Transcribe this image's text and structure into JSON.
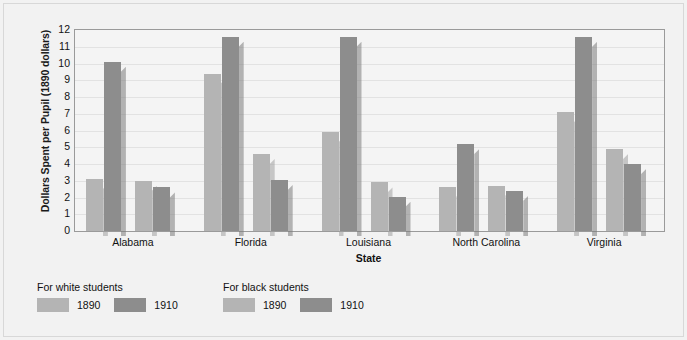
{
  "chart_data": {
    "type": "bar",
    "title": "",
    "xlabel": "State",
    "ylabel": "Dollars Spent per Pupil (1890 dollars)",
    "ylim": [
      0,
      12
    ],
    "yticks": [
      12,
      11,
      10,
      9,
      8,
      7,
      6,
      5,
      4,
      3,
      2,
      1,
      0
    ],
    "grid": true,
    "legend_position": "below-left",
    "categories": [
      "Alabama",
      "Florida",
      "Louisiana",
      "North Carolina",
      "Virginia"
    ],
    "series": [
      {
        "name": "For white students 1890",
        "group": "For white students",
        "year": "1890",
        "color": "#b4b4b4",
        "values": [
          3.1,
          9.4,
          5.9,
          2.65,
          7.1
        ]
      },
      {
        "name": "For white students 1910",
        "group": "For white students",
        "year": "1910",
        "color": "#8d8d8d",
        "values": [
          10.1,
          11.6,
          11.6,
          5.2,
          11.6
        ]
      },
      {
        "name": "For black students 1890",
        "group": "For black students",
        "year": "1890",
        "color": "#b4b4b4",
        "values": [
          3.0,
          4.6,
          2.9,
          2.7,
          4.9
        ]
      },
      {
        "name": "For black students 1910",
        "group": "For black students",
        "year": "1910",
        "color": "#8d8d8d",
        "values": [
          2.6,
          3.05,
          2.05,
          2.4,
          4.0
        ]
      }
    ]
  },
  "axis": {
    "y_title": "Dollars Spent per Pupil (1890 dollars)",
    "x_title": "State",
    "y_ticks": [
      "12",
      "11",
      "10",
      "9",
      "8",
      "7",
      "6",
      "5",
      "4",
      "3",
      "2",
      "1",
      "0"
    ],
    "x_labels": [
      "Alabama",
      "Florida",
      "Louisiana",
      "North Carolina",
      "Virginia"
    ]
  },
  "legend": {
    "groups": [
      {
        "title": "For white students",
        "items": [
          {
            "label": "1890",
            "color": "#b4b4b4",
            "shade": "light"
          },
          {
            "label": "1910",
            "color": "#8d8d8d",
            "shade": "dark"
          }
        ]
      },
      {
        "title": "For black students",
        "items": [
          {
            "label": "1890",
            "color": "#b4b4b4",
            "shade": "light"
          },
          {
            "label": "1910",
            "color": "#8d8d8d",
            "shade": "dark"
          }
        ]
      }
    ]
  },
  "colors": {
    "light_gray": "#b4b4b4",
    "dark_gray": "#8d8d8d",
    "plot_bg": "#f4f4f4",
    "page_bg": "#f2f2f2",
    "axis_line": "#9a9a9a",
    "gridline": "#e2e2e2",
    "text": "#111111"
  }
}
